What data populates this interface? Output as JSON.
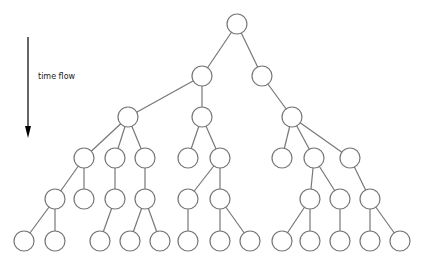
{
  "diagram": {
    "type": "tree",
    "label": "time flow",
    "colors": {
      "edge": "#777777",
      "node_fill": "#ffffff",
      "arrow": "#000000"
    },
    "node_radius": 10,
    "arrow": {
      "x": 28,
      "y1": 37,
      "y2": 138
    },
    "nodes": [
      {
        "id": "n0",
        "x": 237,
        "y": 24
      },
      {
        "id": "n1",
        "x": 202,
        "y": 76
      },
      {
        "id": "n2",
        "x": 262,
        "y": 76
      },
      {
        "id": "n3",
        "x": 128,
        "y": 117
      },
      {
        "id": "n4",
        "x": 202,
        "y": 117
      },
      {
        "id": "n5",
        "x": 292,
        "y": 117
      },
      {
        "id": "n6",
        "x": 84,
        "y": 158
      },
      {
        "id": "n7",
        "x": 115,
        "y": 158
      },
      {
        "id": "n8",
        "x": 145,
        "y": 158
      },
      {
        "id": "n9",
        "x": 188,
        "y": 158
      },
      {
        "id": "n10",
        "x": 220,
        "y": 158
      },
      {
        "id": "n11",
        "x": 282,
        "y": 158
      },
      {
        "id": "n12",
        "x": 314,
        "y": 158
      },
      {
        "id": "n13",
        "x": 350,
        "y": 158
      },
      {
        "id": "n14",
        "x": 55,
        "y": 199
      },
      {
        "id": "n15",
        "x": 84,
        "y": 199
      },
      {
        "id": "n16",
        "x": 115,
        "y": 199
      },
      {
        "id": "n17",
        "x": 145,
        "y": 199
      },
      {
        "id": "n18",
        "x": 188,
        "y": 199
      },
      {
        "id": "n19",
        "x": 220,
        "y": 199
      },
      {
        "id": "n20",
        "x": 310,
        "y": 199
      },
      {
        "id": "n21",
        "x": 340,
        "y": 199
      },
      {
        "id": "n22",
        "x": 370,
        "y": 199
      },
      {
        "id": "n23",
        "x": 24,
        "y": 241
      },
      {
        "id": "n24",
        "x": 55,
        "y": 241
      },
      {
        "id": "n25",
        "x": 100,
        "y": 241
      },
      {
        "id": "n26",
        "x": 130,
        "y": 241
      },
      {
        "id": "n27",
        "x": 160,
        "y": 241
      },
      {
        "id": "n28",
        "x": 188,
        "y": 241
      },
      {
        "id": "n29",
        "x": 220,
        "y": 241
      },
      {
        "id": "n30",
        "x": 250,
        "y": 241
      },
      {
        "id": "n31",
        "x": 282,
        "y": 241
      },
      {
        "id": "n32",
        "x": 310,
        "y": 241
      },
      {
        "id": "n33",
        "x": 340,
        "y": 241
      },
      {
        "id": "n34",
        "x": 370,
        "y": 241
      },
      {
        "id": "n35",
        "x": 400,
        "y": 241
      }
    ],
    "edges": [
      [
        "n0",
        "n1"
      ],
      [
        "n0",
        "n2"
      ],
      [
        "n1",
        "n3"
      ],
      [
        "n1",
        "n4"
      ],
      [
        "n2",
        "n5"
      ],
      [
        "n3",
        "n6"
      ],
      [
        "n3",
        "n7"
      ],
      [
        "n3",
        "n8"
      ],
      [
        "n4",
        "n9"
      ],
      [
        "n4",
        "n10"
      ],
      [
        "n5",
        "n11"
      ],
      [
        "n5",
        "n12"
      ],
      [
        "n5",
        "n13"
      ],
      [
        "n6",
        "n14"
      ],
      [
        "n6",
        "n15"
      ],
      [
        "n7",
        "n16"
      ],
      [
        "n8",
        "n17"
      ],
      [
        "n10",
        "n18"
      ],
      [
        "n10",
        "n19"
      ],
      [
        "n12",
        "n20"
      ],
      [
        "n12",
        "n21"
      ],
      [
        "n13",
        "n22"
      ],
      [
        "n14",
        "n23"
      ],
      [
        "n14",
        "n24"
      ],
      [
        "n16",
        "n25"
      ],
      [
        "n17",
        "n26"
      ],
      [
        "n17",
        "n27"
      ],
      [
        "n18",
        "n28"
      ],
      [
        "n19",
        "n29"
      ],
      [
        "n19",
        "n30"
      ],
      [
        "n20",
        "n31"
      ],
      [
        "n20",
        "n32"
      ],
      [
        "n21",
        "n33"
      ],
      [
        "n22",
        "n34"
      ],
      [
        "n22",
        "n35"
      ]
    ]
  }
}
